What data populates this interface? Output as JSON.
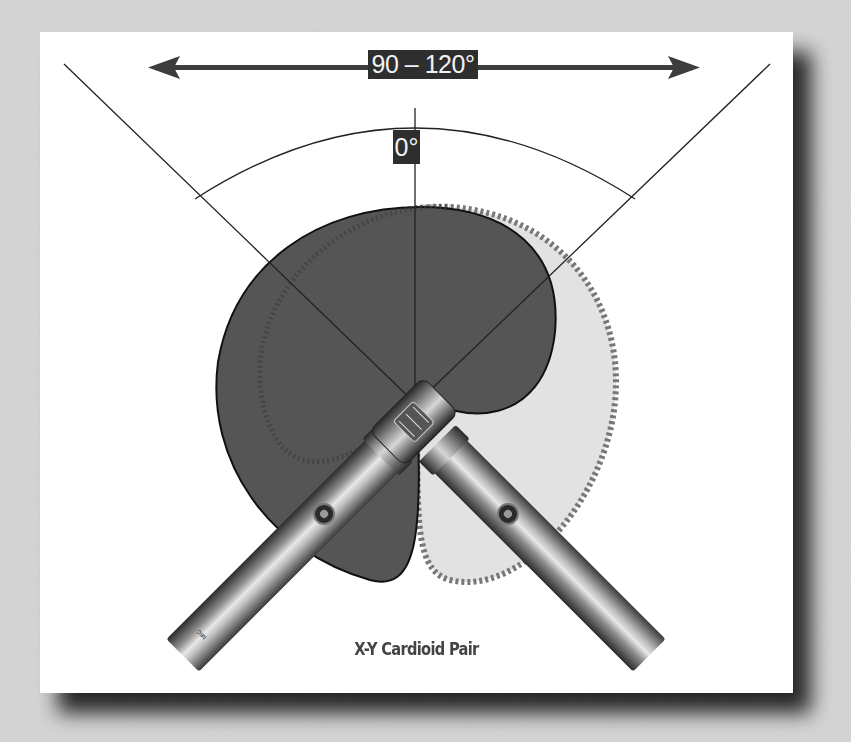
{
  "diagram": {
    "title": "X-Y Cardioid Pair",
    "pickup_angle_label": "90 – 120°",
    "axis_label": "0°",
    "elements": {
      "range_arrow": "double-headed arrow indicating 90–120° angle between mics",
      "left_cardioid": "dark filled cardioid polar pattern (left mic)",
      "right_cardioid": "light filled cardioid polar pattern with dashed border (right mic)",
      "microphones": [
        "left pencil condenser mic",
        "right pencil condenser mic"
      ],
      "guide_lines": [
        "left mic axis line",
        "center 0° axis line",
        "right mic axis line"
      ],
      "arc": "angle arc between mic axes"
    },
    "colors": {
      "background": "#cfcfcf",
      "panel": "#ffffff",
      "dark_cardioid": "#555555",
      "light_cardioid": "#e2e2e2",
      "label_box": "#2e2e2e",
      "label_text": "#f2f2f2",
      "caption_text": "#444444",
      "arrow": "#3d3d3d"
    }
  }
}
